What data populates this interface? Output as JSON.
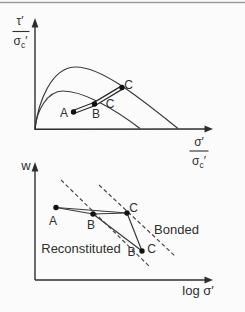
{
  "figure": {
    "top_plot": {
      "description": "normalized shear strength envelopes: bonded (outer) and reconstituted (inner) with stress path A-B-C",
      "y_label": {
        "num": "τ′",
        "den_sigma": "σ",
        "den_sub": "c",
        "den_prime": "′"
      },
      "x_label": {
        "num": "σ′",
        "den_sigma": "σ",
        "den_sub": "c",
        "den_prime": "′"
      },
      "point_labels": {
        "a": "A",
        "b": "B",
        "c_upper": "C",
        "c_lower": "C"
      }
    },
    "bottom_plot": {
      "description": "water content vs log effective stress: compression paths with yield",
      "y_label": "w",
      "x_label": "log σ′",
      "point_labels": {
        "a": "A",
        "b": "B",
        "c": "C",
        "b2": "B",
        "c2": "C"
      },
      "line_labels": {
        "reconstituted": "Reconstituted",
        "bonded": "Bonded"
      }
    }
  }
}
